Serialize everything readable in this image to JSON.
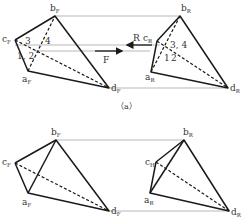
{
  "figure_a": {
    "caption": "（a）",
    "front_view": {
      "vertices": {
        "b": {
          "label": "b",
          "sub": "F",
          "x": 55,
          "y": 16
        },
        "c": {
          "label": "c",
          "sub": "F",
          "x": 15,
          "y": 40
        },
        "a": {
          "label": "a",
          "sub": "F",
          "x": 28,
          "y": 71
        },
        "d": {
          "label": "d",
          "sub": "F",
          "x": 109,
          "y": 88
        }
      },
      "point_labels": {
        "p3": "3",
        "p4": "4",
        "p12": "1, 2"
      }
    },
    "side_view": {
      "vertices": {
        "b": {
          "label": "b",
          "sub": "R",
          "x": 180,
          "y": 16
        },
        "c": {
          "label": "c",
          "sub": "R",
          "x": 157,
          "y": 41
        },
        "a": {
          "label": "a",
          "sub": "R",
          "x": 151,
          "y": 72
        },
        "d": {
          "label": "d",
          "sub": "R",
          "x": 228,
          "y": 88
        }
      },
      "point_labels": {
        "p34": "3, 4",
        "p1": "1",
        "p2": "2"
      }
    },
    "arrows": {
      "F": {
        "label": "F",
        "direction": "right"
      },
      "R": {
        "label": "R",
        "direction": "left"
      }
    }
  },
  "figure_b": {
    "front_view": {
      "vertices": {
        "b": {
          "label": "b",
          "sub": "F",
          "x": 56,
          "y": 140
        },
        "c": {
          "label": "c",
          "sub": "F",
          "x": 15,
          "y": 163
        },
        "a": {
          "label": "a",
          "sub": "F",
          "x": 28,
          "y": 193
        },
        "d": {
          "label": "d",
          "sub": "F",
          "x": 109,
          "y": 211
        }
      }
    },
    "side_view": {
      "vertices": {
        "b": {
          "label": "b",
          "sub": "R",
          "x": 184,
          "y": 140
        },
        "c": {
          "label": "c",
          "sub": "H",
          "x": 156,
          "y": 162
        },
        "a": {
          "label": "a",
          "sub": "R",
          "x": 150,
          "y": 193
        },
        "d": {
          "label": "d",
          "sub": "R",
          "x": 229,
          "y": 211
        }
      }
    }
  },
  "colors": {
    "edge": "#1a1a1a",
    "projection_line": "#999999",
    "text": "#333333"
  }
}
